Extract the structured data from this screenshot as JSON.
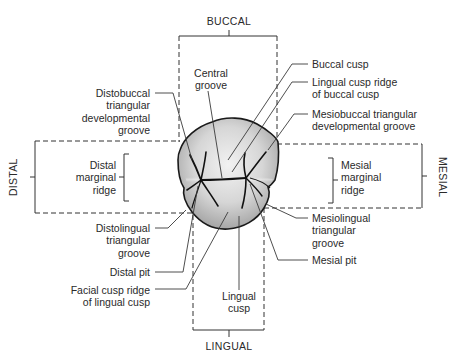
{
  "diagram": {
    "type": "tooth-occlusal-anatomy",
    "orientation_labels": {
      "top": "BUCCAL",
      "bottom": "LINGUAL",
      "left": "DISTAL",
      "right": "MESIAL"
    },
    "labels_left": [
      {
        "id": "distobuccal-triangular-developmental-groove",
        "text": "Distobuccal\ntriangular\ndevelopmental\ngroove"
      },
      {
        "id": "distal-marginal-ridge",
        "text": "Distal\nmarginal\nridge"
      },
      {
        "id": "distolingual-triangular-groove",
        "text": "Distolingual\ntriangular\ngroove"
      },
      {
        "id": "distal-pit",
        "text": "Distal pit"
      },
      {
        "id": "facial-cusp-ridge-of-lingual-cusp",
        "text": "Facial cusp ridge\nof lingual cusp"
      }
    ],
    "labels_center": [
      {
        "id": "central-groove",
        "text": "Central\ngroove"
      },
      {
        "id": "lingual-cusp",
        "text": "Lingual\ncusp"
      }
    ],
    "labels_right": [
      {
        "id": "buccal-cusp",
        "text": "Buccal cusp"
      },
      {
        "id": "lingual-cusp-ridge-of-buccal-cusp",
        "text": "Lingual cusp ridge\nof buccal cusp"
      },
      {
        "id": "mesiobuccal-triangular-developmental-groove",
        "text": "Mesiobuccal triangular\ndevelopmental groove"
      },
      {
        "id": "mesial-marginal-ridge",
        "text": "Mesial\nmarginal\nridge"
      },
      {
        "id": "mesiolingual-triangular-groove",
        "text": "Mesiolingual\ntriangular\ngroove"
      },
      {
        "id": "mesial-pit",
        "text": "Mesial pit"
      }
    ],
    "colors": {
      "text": "#2a2a2a",
      "outline": "#1a1a1a",
      "tooth_fill_light": "#f0f0f0",
      "tooth_fill_dark": "#a8a8a8",
      "leader": "#3a3a3a"
    }
  }
}
